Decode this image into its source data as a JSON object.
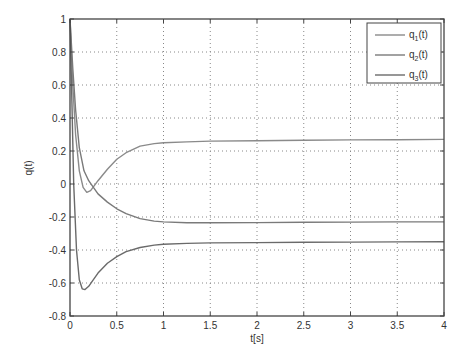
{
  "chart_data": {
    "type": "line",
    "title": "",
    "xlabel": "t[s]",
    "ylabel": "q(t)",
    "xlim": [
      0,
      4
    ],
    "ylim": [
      -0.8,
      1
    ],
    "grid": true,
    "legend_position": "upper right",
    "x_ticks": [
      "0",
      "0.5",
      "1",
      "1.5",
      "2",
      "2.5",
      "3",
      "3.5",
      "4"
    ],
    "y_ticks": [
      "-0.8",
      "-0.6",
      "-0.4",
      "-0.2",
      "0",
      "0.2",
      "0.4",
      "0.6",
      "0.8",
      "1"
    ],
    "series": [
      {
        "name": "q1(t)",
        "label_base": "q",
        "label_sub": "1",
        "label_suffix": "(t)",
        "x": [
          0,
          0.03,
          0.06,
          0.1,
          0.14,
          0.18,
          0.22,
          0.3,
          0.4,
          0.5,
          0.6,
          0.75,
          0.9,
          1.0,
          1.25,
          1.5,
          2.0,
          2.5,
          3.0,
          3.5,
          4.0
        ],
        "values": [
          1.0,
          0.6,
          0.3,
          0.08,
          -0.02,
          -0.05,
          -0.04,
          0.02,
          0.09,
          0.15,
          0.19,
          0.23,
          0.245,
          0.25,
          0.255,
          0.26,
          0.262,
          0.265,
          0.267,
          0.268,
          0.27
        ]
      },
      {
        "name": "q2(t)",
        "label_base": "q",
        "label_sub": "2",
        "label_suffix": "(t)",
        "x": [
          0,
          0.03,
          0.06,
          0.1,
          0.15,
          0.2,
          0.25,
          0.3,
          0.4,
          0.5,
          0.6,
          0.75,
          0.9,
          1.0,
          1.25,
          1.5,
          2.0,
          2.5,
          3.0,
          3.5,
          4.0
        ],
        "values": [
          1.0,
          0.7,
          0.45,
          0.22,
          0.08,
          0.02,
          -0.02,
          -0.06,
          -0.11,
          -0.15,
          -0.18,
          -0.21,
          -0.225,
          -0.23,
          -0.235,
          -0.235,
          -0.234,
          -0.232,
          -0.231,
          -0.23,
          -0.23
        ]
      },
      {
        "name": "q3(t)",
        "label_base": "q",
        "label_sub": "3",
        "label_suffix": "(t)",
        "x": [
          0,
          0.02,
          0.04,
          0.07,
          0.1,
          0.13,
          0.16,
          0.2,
          0.25,
          0.3,
          0.4,
          0.5,
          0.6,
          0.75,
          0.9,
          1.0,
          1.25,
          1.5,
          2.0,
          2.5,
          3.0,
          3.5,
          4.0
        ],
        "values": [
          1.0,
          0.5,
          0.0,
          -0.4,
          -0.58,
          -0.635,
          -0.64,
          -0.62,
          -0.58,
          -0.54,
          -0.48,
          -0.44,
          -0.41,
          -0.385,
          -0.37,
          -0.365,
          -0.36,
          -0.357,
          -0.355,
          -0.353,
          -0.352,
          -0.351,
          -0.35
        ]
      }
    ]
  }
}
